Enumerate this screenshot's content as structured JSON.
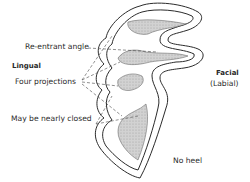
{
  "labels": {
    "reentrant_angle": "Re-entrant angle",
    "lingual": "Lingual",
    "four_projections": "Four projections",
    "may_be_nearly_closed": "May be nearly closed",
    "facial": "Facial",
    "labial": "(Labial)",
    "no_heel": "No heel"
  },
  "colors": {
    "outline": "#2b2b2b",
    "fill": "#c8c8c8",
    "text": "#2a2a2a"
  }
}
